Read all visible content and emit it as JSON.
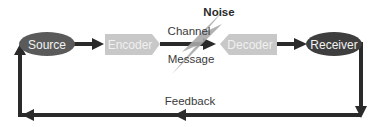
{
  "diagram": {
    "type": "communication-model",
    "nodes": {
      "source": {
        "label": "Source",
        "shape": "ellipse",
        "fill": "#5a5a5a",
        "text_color": "#f2f2f2"
      },
      "encoder": {
        "label": "Encoder",
        "shape": "pentagon-right",
        "fill": "#c8c8c8",
        "text_color": "#f0f0f0"
      },
      "decoder": {
        "label": "Decoder",
        "shape": "pentagon-left",
        "fill": "#c8c8c8",
        "text_color": "#f0f0f0"
      },
      "receiver": {
        "label": "Receiver",
        "shape": "ellipse",
        "fill": "#3e3e3e",
        "text_color": "#f2f2f2"
      }
    },
    "channel": {
      "top_label": "Channel",
      "bottom_label": "Message"
    },
    "noise": {
      "label": "Noise",
      "fill": "#a9a9a9"
    },
    "feedback": {
      "label": "Feedback"
    },
    "edges": [
      {
        "from": "Source",
        "to": "Encoder"
      },
      {
        "from": "Encoder",
        "to": "Decoder",
        "label": "Channel / Message"
      },
      {
        "from": "Decoder",
        "to": "Receiver"
      },
      {
        "from": "Receiver",
        "to": "Source",
        "label": "Feedback"
      }
    ],
    "colors": {
      "arrow": "#2a2a2a",
      "text": "#3a3a3a"
    }
  }
}
